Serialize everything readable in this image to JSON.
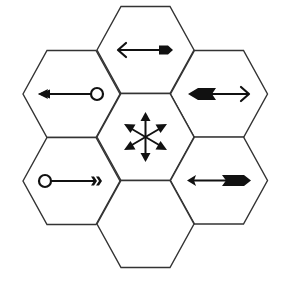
{
  "diagram": {
    "type": "hexagon-grid",
    "hex_count": 7,
    "colors": {
      "background": "#ffffff",
      "stroke": "#333333",
      "glyph": "#111111"
    },
    "hexagons": [
      {
        "id": "top",
        "position": "top-center",
        "symbol": "double-arrow-open-left-solid-right"
      },
      {
        "id": "upper-left",
        "position": "upper-left",
        "symbol": "arrow-left-from-circle"
      },
      {
        "id": "upper-right",
        "position": "upper-right",
        "symbol": "double-arrow-fletched-left-open-right"
      },
      {
        "id": "center",
        "position": "center",
        "symbol": "six-way-arrows"
      },
      {
        "id": "lower-left",
        "position": "lower-left",
        "symbol": "circle-to-fletched-right"
      },
      {
        "id": "lower-right",
        "position": "lower-right",
        "symbol": "double-arrow-small-left-fletched-right"
      },
      {
        "id": "bottom",
        "position": "bottom-center",
        "symbol": "empty"
      }
    ]
  }
}
